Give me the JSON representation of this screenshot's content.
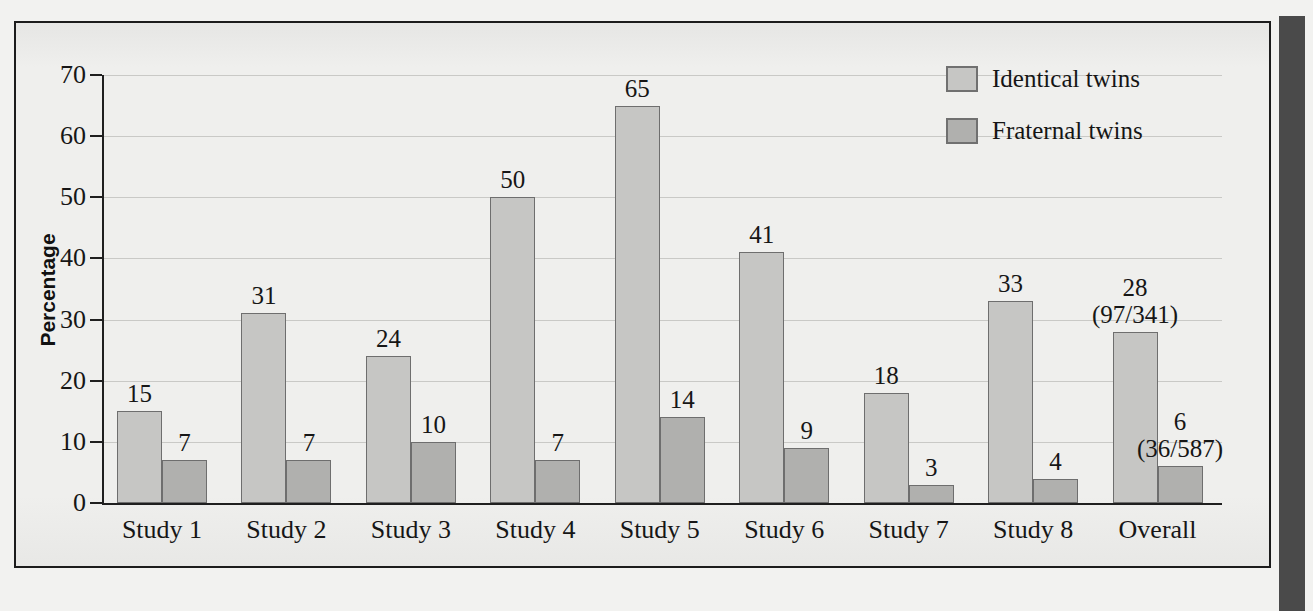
{
  "figure": {
    "y_axis_title": "Percentage"
  },
  "legend": {
    "position": "top-right",
    "entries": [
      {
        "label": "Identical twins",
        "color": "#c6c6c4"
      },
      {
        "label": "Fraternal twins",
        "color": "#b0b0ae"
      }
    ]
  },
  "chart_data": {
    "type": "bar",
    "title": "",
    "xlabel": "",
    "ylabel": "Percentage",
    "ylim": [
      0,
      70
    ],
    "yticks": [
      0,
      10,
      20,
      30,
      40,
      50,
      60,
      70
    ],
    "ytick_labels": [
      "0",
      "10",
      "20",
      "30",
      "40",
      "50",
      "60",
      "70"
    ],
    "grid": true,
    "categories": [
      "Study 1",
      "Study 2",
      "Study 3",
      "Study 4",
      "Study 5",
      "Study 6",
      "Study 7",
      "Study 8",
      "Overall"
    ],
    "series": [
      {
        "name": "Identical twins",
        "color": "#c6c6c4",
        "values": [
          15,
          31,
          24,
          50,
          65,
          41,
          18,
          33,
          28
        ],
        "labels": [
          "15",
          "31",
          "24",
          "50",
          "65",
          "41",
          "18",
          "33",
          "28"
        ],
        "sublabels": [
          "",
          "",
          "",
          "",
          "",
          "",
          "",
          "",
          "(97/341)"
        ]
      },
      {
        "name": "Fraternal twins",
        "color": "#b0b0ae",
        "values": [
          7,
          7,
          10,
          7,
          14,
          9,
          3,
          4,
          6
        ],
        "labels": [
          "7",
          "7",
          "10",
          "7",
          "14",
          "9",
          "3",
          "4",
          "6"
        ],
        "sublabels": [
          "",
          "",
          "",
          "",
          "",
          "",
          "",
          "",
          "(36/587)"
        ]
      }
    ]
  }
}
